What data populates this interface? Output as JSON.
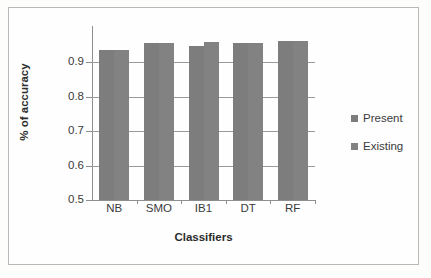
{
  "chart_data": {
    "type": "bar",
    "title": "",
    "xlabel": "Classifiers",
    "ylabel": "% of accuracy",
    "categories": [
      "NB",
      "SMO",
      "IB1",
      "DT",
      "RF"
    ],
    "series": [
      {
        "name": "Present",
        "values": [
          0.935,
          0.955,
          0.948,
          0.955,
          0.963
        ]
      },
      {
        "name": "Existing",
        "values": [
          0.935,
          0.957,
          0.958,
          0.956,
          0.963
        ]
      }
    ],
    "ylim": [
      0.5,
      1.0
    ],
    "ytick_labels": [
      "0.5",
      "0.6",
      "0.7",
      "0.8",
      "0.9"
    ],
    "ytick_values": [
      0.5,
      0.6,
      0.7,
      0.8,
      0.9
    ],
    "grid": true,
    "legend_position": "right",
    "colors": {
      "present": "#7d7d7d",
      "existing": "#828282",
      "gridline": "#9a9a9a",
      "axis": "#8e8e8e",
      "text": "#3b3b3b",
      "background": "#fefefe",
      "border": "#b9b9b9"
    }
  },
  "axis": {
    "y_title": "% of accuracy",
    "x_title": "Classifiers"
  },
  "legend": {
    "items": [
      {
        "label": "Present",
        "color": "#7d7d7d"
      },
      {
        "label": "Existing",
        "color": "#828282"
      }
    ]
  }
}
